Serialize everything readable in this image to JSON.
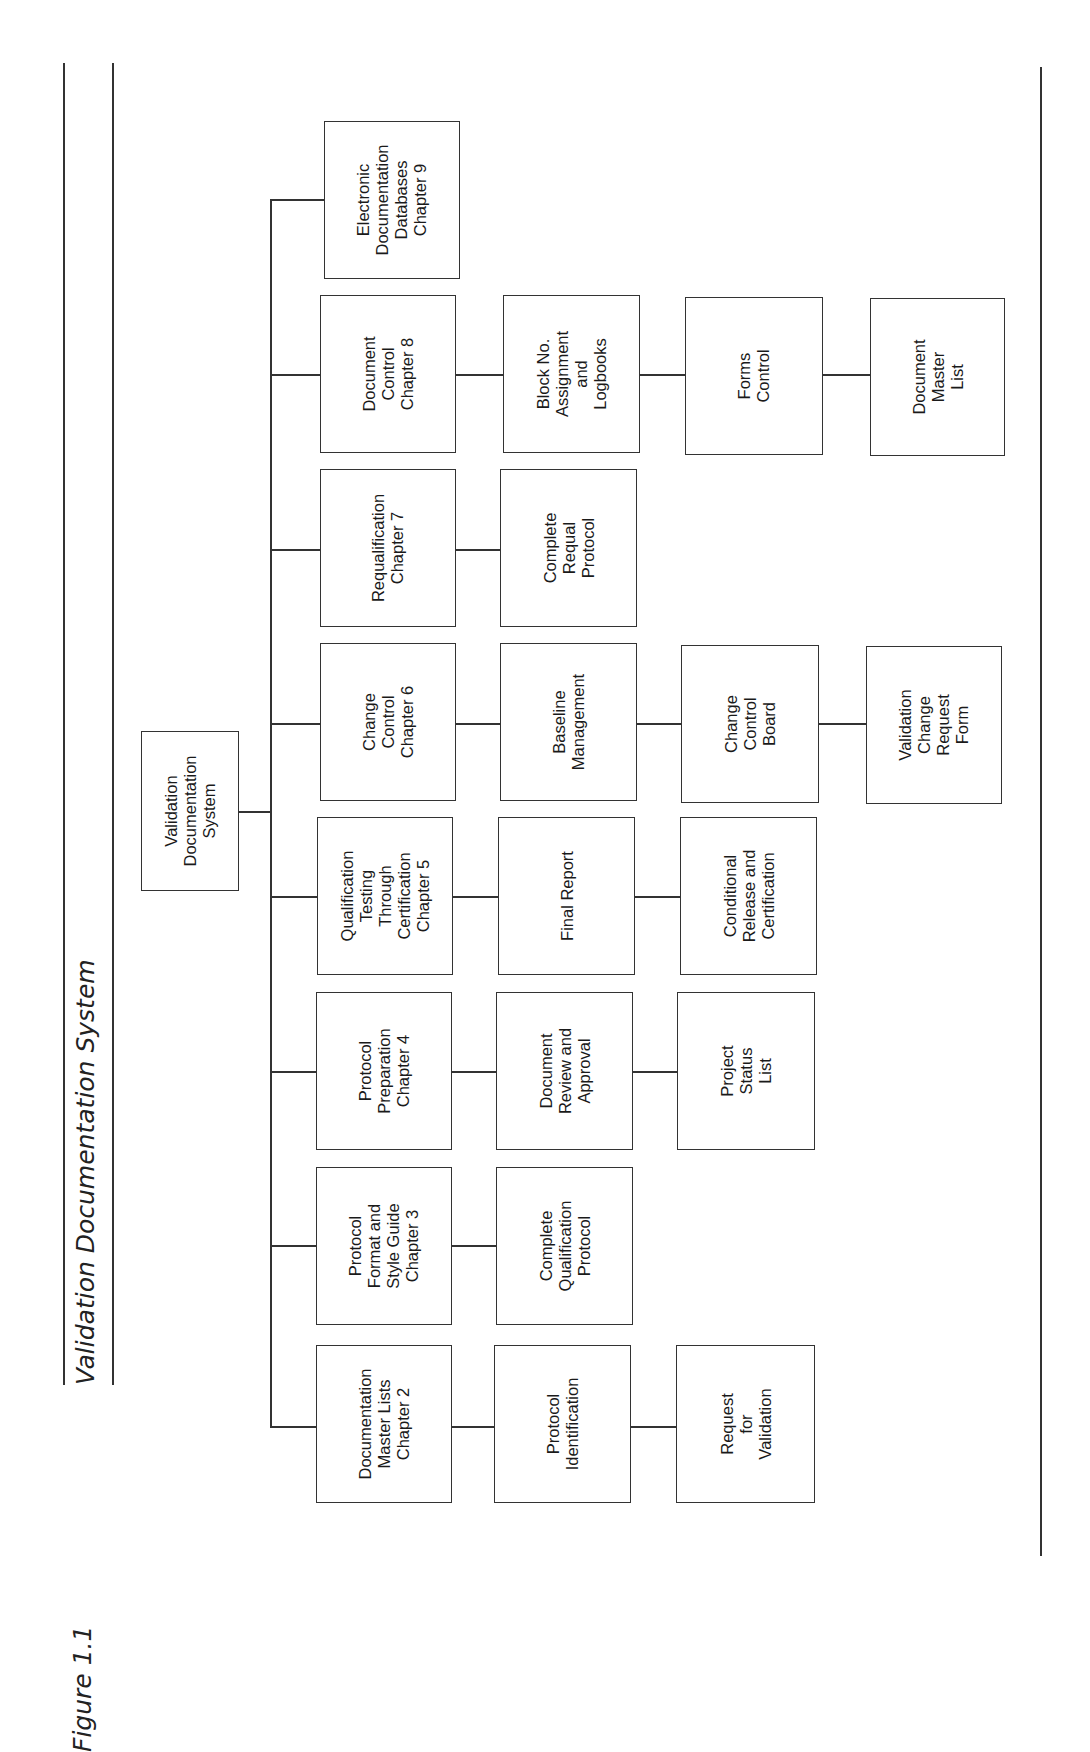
{
  "figure": {
    "label": "Figure 1.1",
    "title": "Validation Documentation System"
  },
  "root": {
    "label": "Validation\nDocumentation\nSystem",
    "box": {
      "x": 141,
      "y": 731,
      "w": 98,
      "h": 160
    }
  },
  "trunk": {
    "x": 270,
    "y_top": 199,
    "y_bottom": 1425
  },
  "columns": [
    {
      "y_center": 1426,
      "nodes": [
        {
          "label": "Documentation\nMaster Lists\nChapter 2",
          "box": {
            "x": 316,
            "y": 1345,
            "w": 136,
            "h": 158
          }
        },
        {
          "label": "Protocol\nIdentification",
          "box": {
            "x": 494,
            "y": 1345,
            "w": 137,
            "h": 158
          }
        },
        {
          "label": "Request\nfor\nValidation",
          "box": {
            "x": 676,
            "y": 1345,
            "w": 139,
            "h": 158
          }
        }
      ]
    },
    {
      "y_center": 1245,
      "nodes": [
        {
          "label": "Protocol\nFormat and\nStyle Guide\nChapter 3",
          "box": {
            "x": 316,
            "y": 1167,
            "w": 136,
            "h": 158
          }
        },
        {
          "label": "Complete\nQualification\nProtocol",
          "box": {
            "x": 496,
            "y": 1167,
            "w": 137,
            "h": 158
          }
        }
      ]
    },
    {
      "y_center": 1071,
      "nodes": [
        {
          "label": "Protocol\nPreparation\nChapter 4",
          "box": {
            "x": 316,
            "y": 992,
            "w": 136,
            "h": 158
          }
        },
        {
          "label": "Document\nReview and\nApproval",
          "box": {
            "x": 496,
            "y": 992,
            "w": 137,
            "h": 158
          }
        },
        {
          "label": "Project\nStatus\nList",
          "box": {
            "x": 677,
            "y": 992,
            "w": 138,
            "h": 158
          }
        }
      ]
    },
    {
      "y_center": 896,
      "nodes": [
        {
          "label": "Qualification\nTesting\nThrough\nCertification\nChapter 5",
          "box": {
            "x": 317,
            "y": 817,
            "w": 136,
            "h": 158
          }
        },
        {
          "label": "Final Report",
          "box": {
            "x": 498,
            "y": 817,
            "w": 137,
            "h": 158
          }
        },
        {
          "label": "Conditional\nRelease and\nCertification",
          "box": {
            "x": 680,
            "y": 817,
            "w": 137,
            "h": 158
          }
        }
      ]
    },
    {
      "y_center": 723,
      "nodes": [
        {
          "label": "Change\nControl\nChapter 6",
          "box": {
            "x": 320,
            "y": 643,
            "w": 136,
            "h": 158
          }
        },
        {
          "label": "Baseline\nManagement",
          "box": {
            "x": 500,
            "y": 643,
            "w": 137,
            "h": 158
          }
        },
        {
          "label": "Change\nControl\nBoard",
          "box": {
            "x": 681,
            "y": 645,
            "w": 138,
            "h": 158
          }
        },
        {
          "label": "Validation\nChange\nRequest\nForm",
          "box": {
            "x": 866,
            "y": 646,
            "w": 136,
            "h": 158
          }
        }
      ]
    },
    {
      "y_center": 549,
      "nodes": [
        {
          "label": "Requalification\nChapter 7",
          "box": {
            "x": 320,
            "y": 469,
            "w": 136,
            "h": 158
          }
        },
        {
          "label": "Complete\nRequal\nProtocol",
          "box": {
            "x": 500,
            "y": 469,
            "w": 137,
            "h": 158
          }
        }
      ]
    },
    {
      "y_center": 374,
      "nodes": [
        {
          "label": "Document\nControl\nChapter 8",
          "box": {
            "x": 320,
            "y": 295,
            "w": 136,
            "h": 158
          }
        },
        {
          "label": "Block No.\nAssignment\nand\nLogbooks",
          "box": {
            "x": 503,
            "y": 295,
            "w": 137,
            "h": 158
          }
        },
        {
          "label": "Forms\nControl",
          "box": {
            "x": 685,
            "y": 297,
            "w": 138,
            "h": 158
          }
        },
        {
          "label": "Document\nMaster\nList",
          "box": {
            "x": 870,
            "y": 298,
            "w": 135,
            "h": 158
          }
        }
      ]
    },
    {
      "y_center": 199,
      "nodes": [
        {
          "label": "Electronic\nDocumentation\nDatabases\nChapter 9",
          "box": {
            "x": 324,
            "y": 121,
            "w": 136,
            "h": 158
          }
        }
      ]
    }
  ],
  "rules": {
    "left_outer": {
      "x": 63,
      "y_top": 63,
      "y_bottom": 1385
    },
    "left_inner": {
      "x": 113,
      "y_top": 63,
      "y_bottom": 1385
    },
    "right": {
      "x": 1040,
      "y_top": 67,
      "y_bottom": 1556
    }
  }
}
